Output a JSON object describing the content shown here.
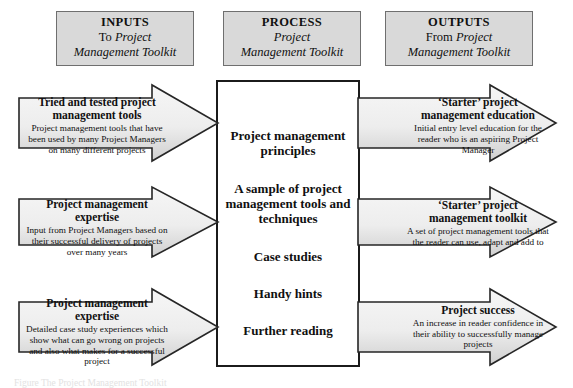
{
  "diagram": {
    "type": "input-process-output-flow",
    "headers": [
      {
        "id": "inputs",
        "title": "INPUTS",
        "line2_pre": "To ",
        "line2_italic": "Project",
        "line3_italic": "Management Toolkit"
      },
      {
        "id": "process",
        "title": "PROCESS",
        "line2_pre": "",
        "line2_italic": "Project",
        "line3_italic": "Management Toolkit"
      },
      {
        "id": "outputs",
        "title": "OUTPUTS",
        "line2_pre": "From ",
        "line2_italic": "Project",
        "line3_italic": "Management Toolkit"
      }
    ],
    "process_box": {
      "items": [
        "Project management principles",
        "A sample of project management tools and techniques",
        "Case studies",
        "Handy hints",
        "Further reading"
      ]
    },
    "inputs": [
      {
        "title": "Tried and tested project management tools",
        "body": "Project management tools that have been used by many Project Managers on many different projects"
      },
      {
        "title": "Project management expertise",
        "body": "Input from Project Managers based on their successful delivery of projects over many years"
      },
      {
        "title": "Project management expertise",
        "body": "Detailed case study experiences which show what can go wrong on projects and also what makes for a successful project"
      }
    ],
    "outputs": [
      {
        "title": "‘Starter’ project management education",
        "body": "Initial entry level education for the reader who is an aspiring Project Manager"
      },
      {
        "title": "‘Starter’ project management toolkit",
        "body": "A set of project management tools that the reader can use, adapt and add to"
      },
      {
        "title": "Project success",
        "body": "An increase in reader confidence in their ability to successfully manage projects"
      }
    ],
    "caption": "Figure  The Project Management Toolkit",
    "colors": {
      "header_fill": "#d9d9d9",
      "header_border": "#6f6f6f",
      "process_border": "#1b1b1b",
      "arrow_fill_top": "#f4f4f4",
      "arrow_fill_bottom": "#d2d2d2",
      "arrow_border": "#2a2a2a",
      "text": "#101010",
      "background": "#ffffff"
    }
  }
}
